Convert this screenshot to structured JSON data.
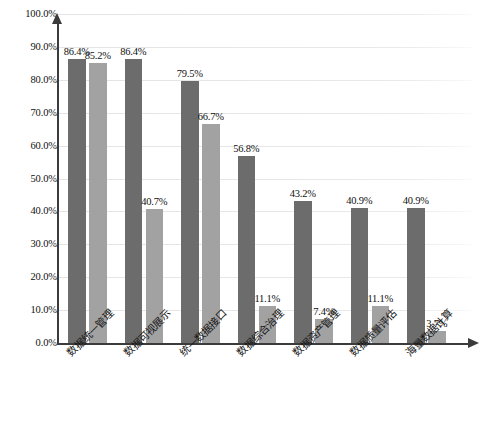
{
  "chart_data": {
    "type": "bar",
    "title": "",
    "xlabel": "",
    "ylabel": "",
    "ylim": [
      0,
      100
    ],
    "ytick_labels": [
      "100.0%",
      "90.0%",
      "80.0%",
      "70.0%",
      "60.0%",
      "50.0%",
      "40.0%",
      "30.0%",
      "20.0%",
      "10.0%",
      "0.0%"
    ],
    "ytick_values": [
      100,
      90,
      80,
      70,
      60,
      50,
      40,
      30,
      20,
      10,
      0
    ],
    "grid": true,
    "legend_position": "bottom",
    "categories": [
      "数据统一管理",
      "数据可视展示",
      "统一数据接口",
      "数据综合治理",
      "数据资产管理",
      "数据质量评估",
      "海量数据计算"
    ],
    "series": [
      {
        "name": "series-1",
        "color": "#6c6c6c",
        "values": [
          86.4,
          86.4,
          79.5,
          56.8,
          43.2,
          40.9,
          40.9
        ],
        "labels": [
          "86.4%",
          "86.4%",
          "79.5%",
          "56.8%",
          "43.2%",
          "40.9%",
          "40.9%"
        ]
      },
      {
        "name": "series-2",
        "color": "#a2a2a2",
        "values": [
          85.2,
          40.7,
          66.7,
          11.1,
          7.4,
          11.1,
          3.7
        ],
        "labels": [
          "85.2%",
          "40.7%",
          "66.7%",
          "11.1%",
          "7.4%",
          "11.1%",
          "3.7%"
        ]
      }
    ]
  },
  "colors": {
    "series_1": "#6c6c6c",
    "series_2": "#a2a2a2",
    "axis": "#3b3b3b",
    "gridline": "#e6e6e6",
    "text": "#111111"
  },
  "caption": ""
}
